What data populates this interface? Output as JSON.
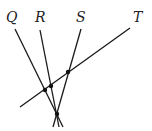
{
  "diagram": {
    "labels": {
      "Q": "Q",
      "R": "R",
      "S": "S",
      "T": "T"
    },
    "lines": [
      {
        "name": "Q",
        "x1": 15,
        "y1": 29,
        "x2": 63,
        "y2": 127
      },
      {
        "name": "R",
        "x1": 40,
        "y1": 30,
        "x2": 59,
        "y2": 127
      },
      {
        "name": "S",
        "x1": 81,
        "y1": 29,
        "x2": 53,
        "y2": 127
      },
      {
        "name": "T",
        "x1": 130,
        "y1": 28,
        "x2": 20,
        "y2": 107
      }
    ],
    "points": [
      {
        "name": "Q-T-intersection",
        "cx": 45,
        "cy": 90
      },
      {
        "name": "R-T-intersection",
        "cx": 51,
        "cy": 86
      },
      {
        "name": "S-T-intersection",
        "cx": 68,
        "cy": 72
      },
      {
        "name": "Q-R-S-intersection",
        "cx": 57,
        "cy": 114
      }
    ]
  }
}
